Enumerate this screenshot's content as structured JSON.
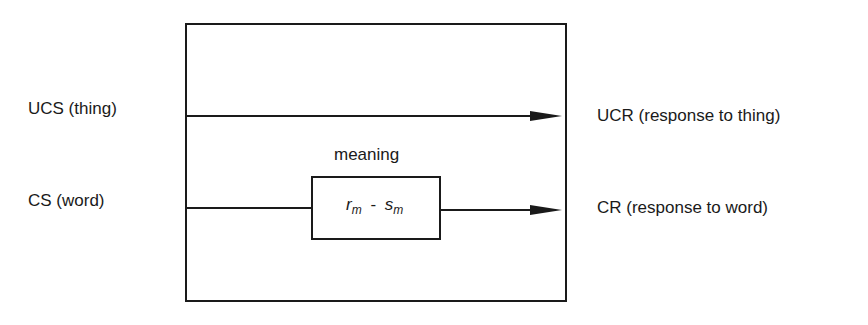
{
  "diagram": {
    "inputs": {
      "ucs": "UCS (thing)",
      "cs": "CS (word)"
    },
    "outputs": {
      "ucr": "UCR (response to thing)",
      "cr": "CR (response to word)"
    },
    "mediator": {
      "label": "meaning",
      "r": "r",
      "r_sub": "m",
      "dash": "-",
      "s": "s",
      "s_sub": "m"
    },
    "colors": {
      "line": "#1a1a1a",
      "background": "#ffffff"
    }
  }
}
